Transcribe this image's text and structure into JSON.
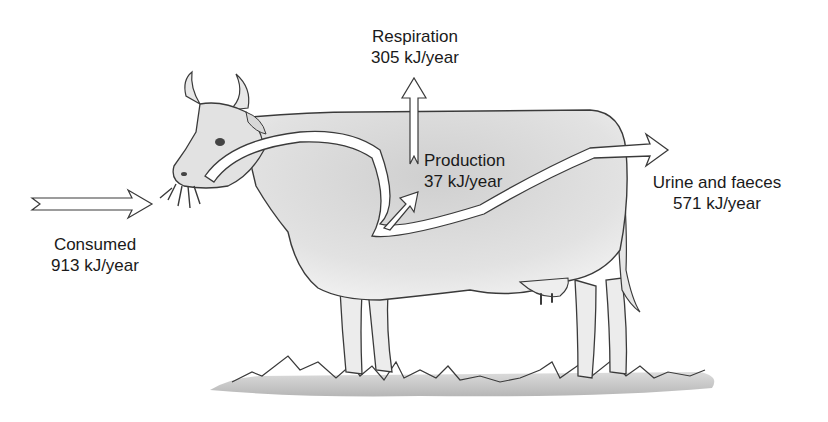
{
  "diagram": {
    "units": "kJ/year",
    "flows": [
      {
        "id": "consumed",
        "name": "Consumed",
        "value": "913 kJ/year",
        "direction": "in"
      },
      {
        "id": "respiration",
        "name": "Respiration",
        "value": "305 kJ/year",
        "direction": "up"
      },
      {
        "id": "production",
        "name": "Production",
        "value": "37 kJ/year",
        "direction": "internal"
      },
      {
        "id": "waste",
        "name": "Urine and faeces",
        "value": "571 kJ/year",
        "direction": "out"
      }
    ]
  },
  "labels": {
    "consumed": {
      "name": "Consumed",
      "value": "913 kJ/year"
    },
    "respiration": {
      "name": "Respiration",
      "value": "305 kJ/year"
    },
    "production": {
      "name": "Production",
      "value": "37 kJ/year"
    },
    "waste": {
      "name": "Urine and faeces",
      "value": "571 kJ/year"
    }
  },
  "colors": {
    "body_shade": "#d9d9d9",
    "outline": "#3a3a3a",
    "arrow_fill": "#ffffff",
    "grass": "#bdbdbd"
  }
}
